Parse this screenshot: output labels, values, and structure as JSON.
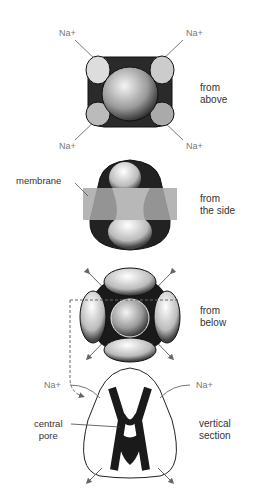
{
  "figure": {
    "views": [
      {
        "id": "above",
        "caption_line1": "from",
        "caption_line2": "above",
        "ion_labels": [
          "Na+",
          "Na+",
          "Na+",
          "Na+"
        ]
      },
      {
        "id": "side",
        "caption_line1": "from",
        "caption_line2": "the side",
        "callout": "membrane"
      },
      {
        "id": "below",
        "caption_line1": "from",
        "caption_line2": "below"
      },
      {
        "id": "section",
        "caption_line1": "vertical",
        "caption_line2": "section",
        "ion_labels": [
          "Na+",
          "Na+"
        ],
        "callout_line1": "central",
        "callout_line2": "pore"
      }
    ],
    "colors": {
      "protein_dark": "#1a1a1a",
      "protein_light": "#e6e6e6",
      "membrane": "#a8a8a8",
      "arrow": "#666666",
      "label": "#333333"
    }
  }
}
